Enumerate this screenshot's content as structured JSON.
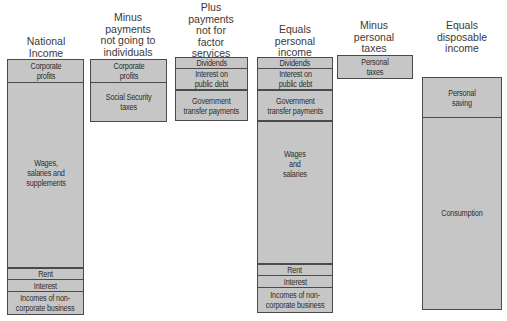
{
  "diagram": {
    "colors": {
      "segment_fill": "#c6c6c6",
      "border": "#4a4a4a",
      "text": "#2e2e2e",
      "background": "#ffffff"
    },
    "columns": [
      {
        "id": "national-income",
        "header": "National\nIncome",
        "segments": [
          {
            "label": "Corporate\nprofits"
          },
          {
            "label": "Wages,\nsalaries and\nsupplements"
          },
          {
            "label": "Rent"
          },
          {
            "label": "Interest"
          },
          {
            "label": "Incomes of non-\ncorporate business"
          }
        ]
      },
      {
        "id": "minus-payments-not-going-to-individuals",
        "header": "Minus\npayments\nnot going to\nindividuals",
        "segments": [
          {
            "label": "Corporate\nprofits"
          },
          {
            "label": "Social Security\ntaxes"
          }
        ]
      },
      {
        "id": "plus-payments-not-for-factor-services",
        "header": "Plus\npayments\nnot for\nfactor\nservices",
        "segments": [
          {
            "label": "Dividends"
          },
          {
            "label": "Interest on\npublic debt"
          },
          {
            "label": "Government\ntransfer payments"
          }
        ]
      },
      {
        "id": "equals-personal-income",
        "header": "Equals\npersonal\nincome",
        "segments": [
          {
            "label": "Dividends"
          },
          {
            "label": "Interest on\npublic debt"
          },
          {
            "label": "Government\ntransfer payments"
          },
          {
            "label": "Wages\nand\nsalaries"
          },
          {
            "label": "Rent"
          },
          {
            "label": "Interest"
          },
          {
            "label": "Incomes of non-\ncorporate business"
          }
        ]
      },
      {
        "id": "minus-personal-taxes",
        "header": "Minus\npersonal\ntaxes",
        "segments": [
          {
            "label": "Personal\ntaxes"
          }
        ]
      },
      {
        "id": "equals-disposable-income",
        "header": "Equals\ndisposable\nincome",
        "segments": [
          {
            "label": "Personal\nsaving"
          },
          {
            "label": "Consumption"
          }
        ]
      }
    ]
  }
}
